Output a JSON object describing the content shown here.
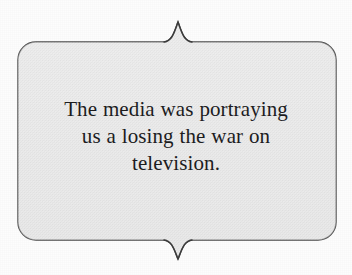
{
  "callout": {
    "shape_name": "bracket-banner-callout",
    "fill_color": "#ececec",
    "stroke_color": "#4a4a4a",
    "background_color": "#fdfdfd",
    "text_color": "#1d1d1f",
    "top_peak": "upward-cusp",
    "bottom_peak": "downward-cusp"
  },
  "quote": {
    "full_text": "The media was portraying us a losing the war on television.",
    "lines": [
      "The media was portraying",
      "us a losing the war on",
      "television."
    ],
    "line1": "The media was portraying",
    "line2": "us a losing the war on",
    "line3": "television."
  }
}
